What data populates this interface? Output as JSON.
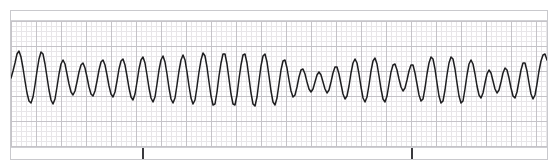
{
  "strip": {
    "kind": "ecg-rhythm-strip",
    "width": 558,
    "height": 168,
    "paper_color": "#ffffff",
    "trace_color": "#1d1d1f",
    "grid_minor_color": "#e8e6e9",
    "grid_major_color": "#c5c3c8",
    "frame_color": "#c9c9cd",
    "grid": {
      "minor_spacing_px": 5,
      "major_spacing_px": 25
    },
    "markers": [
      {
        "name": "event-tick-1",
        "x": 131,
        "color": "#3a3a3e"
      },
      {
        "name": "event-tick-2",
        "x": 400,
        "color": "#3a3a3e"
      }
    ]
  },
  "chart_data": {
    "type": "line",
    "title": "",
    "xlabel": "",
    "ylabel": "",
    "grid": true,
    "legend": null,
    "xlim": [
      0,
      536
    ],
    "ylim": [
      0,
      126
    ],
    "baseline_y": 57,
    "series": [
      {
        "name": "ecg-waveform",
        "color": "#1d1d1f",
        "points": [
          [
            0,
            57
          ],
          [
            2,
            50
          ],
          [
            4,
            42
          ],
          [
            6,
            33
          ],
          [
            8,
            30
          ],
          [
            10,
            36
          ],
          [
            12,
            47
          ],
          [
            14,
            60
          ],
          [
            16,
            72
          ],
          [
            18,
            80
          ],
          [
            20,
            82
          ],
          [
            22,
            76
          ],
          [
            24,
            64
          ],
          [
            26,
            50
          ],
          [
            28,
            38
          ],
          [
            30,
            31
          ],
          [
            32,
            33
          ],
          [
            34,
            43
          ],
          [
            36,
            56
          ],
          [
            38,
            69
          ],
          [
            40,
            79
          ],
          [
            42,
            83
          ],
          [
            44,
            78
          ],
          [
            46,
            66
          ],
          [
            48,
            53
          ],
          [
            50,
            43
          ],
          [
            52,
            39
          ],
          [
            54,
            43
          ],
          [
            56,
            53
          ],
          [
            58,
            63
          ],
          [
            60,
            71
          ],
          [
            62,
            74
          ],
          [
            64,
            70
          ],
          [
            66,
            61
          ],
          [
            68,
            51
          ],
          [
            70,
            44
          ],
          [
            72,
            42
          ],
          [
            74,
            47
          ],
          [
            76,
            56
          ],
          [
            78,
            66
          ],
          [
            80,
            73
          ],
          [
            82,
            75
          ],
          [
            84,
            70
          ],
          [
            86,
            60
          ],
          [
            88,
            49
          ],
          [
            90,
            41
          ],
          [
            92,
            39
          ],
          [
            94,
            44
          ],
          [
            96,
            54
          ],
          [
            98,
            65
          ],
          [
            100,
            73
          ],
          [
            102,
            76
          ],
          [
            104,
            71
          ],
          [
            106,
            60
          ],
          [
            108,
            48
          ],
          [
            110,
            40
          ],
          [
            112,
            38
          ],
          [
            114,
            44
          ],
          [
            116,
            55
          ],
          [
            118,
            67
          ],
          [
            120,
            76
          ],
          [
            122,
            79
          ],
          [
            124,
            73
          ],
          [
            126,
            61
          ],
          [
            128,
            48
          ],
          [
            130,
            39
          ],
          [
            132,
            36
          ],
          [
            134,
            42
          ],
          [
            136,
            54
          ],
          [
            138,
            67
          ],
          [
            140,
            77
          ],
          [
            142,
            81
          ],
          [
            144,
            76
          ],
          [
            146,
            63
          ],
          [
            148,
            49
          ],
          [
            150,
            39
          ],
          [
            152,
            35
          ],
          [
            154,
            41
          ],
          [
            156,
            53
          ],
          [
            158,
            67
          ],
          [
            160,
            78
          ],
          [
            162,
            82
          ],
          [
            164,
            77
          ],
          [
            166,
            64
          ],
          [
            168,
            50
          ],
          [
            170,
            39
          ],
          [
            172,
            34
          ],
          [
            174,
            39
          ],
          [
            176,
            51
          ],
          [
            178,
            65
          ],
          [
            180,
            77
          ],
          [
            182,
            83
          ],
          [
            184,
            79
          ],
          [
            186,
            66
          ],
          [
            188,
            51
          ],
          [
            190,
            39
          ],
          [
            192,
            32
          ],
          [
            194,
            35
          ],
          [
            196,
            46
          ],
          [
            198,
            61
          ],
          [
            200,
            75
          ],
          [
            202,
            84
          ],
          [
            204,
            83
          ],
          [
            206,
            71
          ],
          [
            208,
            55
          ],
          [
            210,
            42
          ],
          [
            212,
            33
          ],
          [
            214,
            33
          ],
          [
            216,
            43
          ],
          [
            218,
            58
          ],
          [
            220,
            73
          ],
          [
            222,
            83
          ],
          [
            224,
            84
          ],
          [
            226,
            74
          ],
          [
            228,
            58
          ],
          [
            230,
            44
          ],
          [
            232,
            34
          ],
          [
            234,
            33
          ],
          [
            236,
            42
          ],
          [
            238,
            57
          ],
          [
            240,
            72
          ],
          [
            242,
            83
          ],
          [
            244,
            85
          ],
          [
            246,
            76
          ],
          [
            248,
            60
          ],
          [
            250,
            45
          ],
          [
            252,
            35
          ],
          [
            254,
            33
          ],
          [
            256,
            41
          ],
          [
            258,
            55
          ],
          [
            260,
            70
          ],
          [
            262,
            81
          ],
          [
            264,
            84
          ],
          [
            266,
            77
          ],
          [
            268,
            63
          ],
          [
            270,
            49
          ],
          [
            272,
            40
          ],
          [
            274,
            39
          ],
          [
            276,
            47
          ],
          [
            278,
            59
          ],
          [
            280,
            70
          ],
          [
            282,
            76
          ],
          [
            284,
            74
          ],
          [
            286,
            66
          ],
          [
            288,
            56
          ],
          [
            290,
            49
          ],
          [
            292,
            48
          ],
          [
            294,
            53
          ],
          [
            296,
            61
          ],
          [
            298,
            68
          ],
          [
            300,
            71
          ],
          [
            302,
            68
          ],
          [
            304,
            61
          ],
          [
            306,
            54
          ],
          [
            308,
            51
          ],
          [
            310,
            54
          ],
          [
            312,
            61
          ],
          [
            314,
            68
          ],
          [
            316,
            72
          ],
          [
            318,
            69
          ],
          [
            320,
            61
          ],
          [
            322,
            52
          ],
          [
            324,
            46
          ],
          [
            326,
            46
          ],
          [
            328,
            53
          ],
          [
            330,
            63
          ],
          [
            332,
            73
          ],
          [
            334,
            78
          ],
          [
            336,
            75
          ],
          [
            338,
            65
          ],
          [
            340,
            52
          ],
          [
            342,
            42
          ],
          [
            344,
            38
          ],
          [
            346,
            42
          ],
          [
            348,
            53
          ],
          [
            350,
            66
          ],
          [
            352,
            77
          ],
          [
            354,
            81
          ],
          [
            356,
            76
          ],
          [
            358,
            64
          ],
          [
            360,
            50
          ],
          [
            362,
            40
          ],
          [
            364,
            37
          ],
          [
            366,
            43
          ],
          [
            368,
            55
          ],
          [
            370,
            68
          ],
          [
            372,
            78
          ],
          [
            374,
            81
          ],
          [
            376,
            75
          ],
          [
            378,
            63
          ],
          [
            380,
            51
          ],
          [
            382,
            44
          ],
          [
            384,
            43
          ],
          [
            386,
            49
          ],
          [
            388,
            58
          ],
          [
            390,
            66
          ],
          [
            392,
            70
          ],
          [
            394,
            67
          ],
          [
            396,
            59
          ],
          [
            398,
            50
          ],
          [
            400,
            44
          ],
          [
            402,
            44
          ],
          [
            404,
            52
          ],
          [
            406,
            63
          ],
          [
            408,
            74
          ],
          [
            410,
            80
          ],
          [
            412,
            78
          ],
          [
            414,
            67
          ],
          [
            416,
            53
          ],
          [
            418,
            42
          ],
          [
            420,
            36
          ],
          [
            422,
            38
          ],
          [
            424,
            48
          ],
          [
            426,
            62
          ],
          [
            428,
            75
          ],
          [
            430,
            82
          ],
          [
            432,
            80
          ],
          [
            434,
            69
          ],
          [
            436,
            54
          ],
          [
            438,
            42
          ],
          [
            440,
            36
          ],
          [
            442,
            38
          ],
          [
            444,
            48
          ],
          [
            446,
            62
          ],
          [
            448,
            75
          ],
          [
            450,
            82
          ],
          [
            452,
            80
          ],
          [
            454,
            68
          ],
          [
            456,
            54
          ],
          [
            458,
            43
          ],
          [
            460,
            39
          ],
          [
            462,
            43
          ],
          [
            464,
            53
          ],
          [
            466,
            65
          ],
          [
            468,
            74
          ],
          [
            470,
            77
          ],
          [
            472,
            72
          ],
          [
            474,
            62
          ],
          [
            476,
            53
          ],
          [
            478,
            49
          ],
          [
            480,
            52
          ],
          [
            482,
            60
          ],
          [
            484,
            68
          ],
          [
            486,
            72
          ],
          [
            488,
            69
          ],
          [
            490,
            61
          ],
          [
            492,
            52
          ],
          [
            494,
            47
          ],
          [
            496,
            49
          ],
          [
            498,
            57
          ],
          [
            500,
            67
          ],
          [
            502,
            75
          ],
          [
            504,
            77
          ],
          [
            506,
            71
          ],
          [
            508,
            60
          ],
          [
            510,
            49
          ],
          [
            512,
            42
          ],
          [
            514,
            42
          ],
          [
            516,
            50
          ],
          [
            518,
            62
          ],
          [
            520,
            73
          ],
          [
            522,
            78
          ],
          [
            524,
            74
          ],
          [
            526,
            63
          ],
          [
            528,
            50
          ],
          [
            530,
            40
          ],
          [
            532,
            34
          ],
          [
            534,
            33
          ],
          [
            536,
            39
          ]
        ]
      }
    ]
  }
}
